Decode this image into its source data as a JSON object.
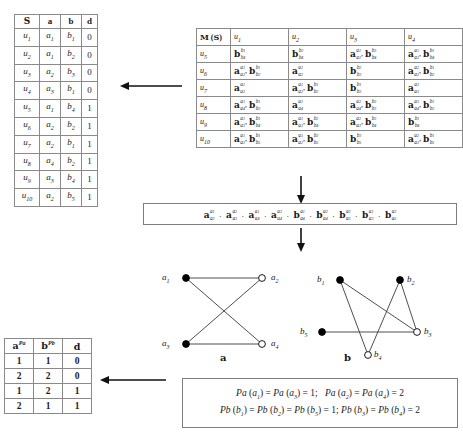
{
  "s_table": {
    "headers": [
      "S",
      "a",
      "b",
      "d"
    ],
    "rows": [
      {
        "u": "u1",
        "a": "a1",
        "b": "b1",
        "d": "0"
      },
      {
        "u": "u2",
        "a": "a1",
        "b": "b2",
        "d": "0"
      },
      {
        "u": "u3",
        "a": "a2",
        "b": "b3",
        "d": "0"
      },
      {
        "u": "u4",
        "a": "a3",
        "b": "b1",
        "d": "0"
      },
      {
        "u": "u5",
        "a": "a1",
        "b": "b4",
        "d": "1"
      },
      {
        "u": "u6",
        "a": "a2",
        "b": "b2",
        "d": "1"
      },
      {
        "u": "u7",
        "a": "a2",
        "b": "b1",
        "d": "1"
      },
      {
        "u": "u8",
        "a": "a4",
        "b": "b2",
        "d": "1"
      },
      {
        "u": "u9",
        "a": "a3",
        "b": "b4",
        "d": "1"
      },
      {
        "u": "u10",
        "a": "a2",
        "b": "b5",
        "d": "1"
      }
    ]
  },
  "m_table": {
    "corner": "M (S)",
    "col_headers": [
      "u1",
      "u2",
      "u3",
      "u4"
    ],
    "row_headers": [
      "u5",
      "u6",
      "u7",
      "u8",
      "u9",
      "u10"
    ],
    "cells": [
      [
        [
          {
            "base": "b",
            "sup": "b1",
            "sub": "b4"
          }
        ],
        [
          {
            "base": "b",
            "sup": "b2",
            "sub": "b4"
          }
        ],
        [
          {
            "base": "a",
            "sup": "a1",
            "sub": "a2"
          },
          {
            "base": "b",
            "sup": "b3",
            "sub": "b4"
          }
        ],
        [
          {
            "base": "a",
            "sup": "a1",
            "sub": "a3"
          },
          {
            "base": "b",
            "sup": "b1",
            "sub": "b4"
          }
        ]
      ],
      [
        [
          {
            "base": "a",
            "sup": "a1",
            "sub": "a2"
          },
          {
            "base": "b",
            "sup": "b1",
            "sub": "b2"
          }
        ],
        [
          {
            "base": "a",
            "sup": "a1",
            "sub": "a2"
          }
        ],
        [
          {
            "base": "b",
            "sup": "b2",
            "sub": "b3"
          }
        ],
        [
          {
            "base": "a",
            "sup": "a2",
            "sub": "a3"
          },
          {
            "base": "b",
            "sup": "b1",
            "sub": "b2"
          }
        ]
      ],
      [
        [
          {
            "base": "a",
            "sup": "a1",
            "sub": "a2"
          }
        ],
        [
          {
            "base": "a",
            "sup": "a1",
            "sub": "a2"
          },
          {
            "base": "b",
            "sup": "b1",
            "sub": "b2"
          }
        ],
        [
          {
            "base": "b",
            "sup": "b1",
            "sub": "b3"
          }
        ],
        [
          {
            "base": "a",
            "sup": "a2",
            "sub": "a3"
          }
        ]
      ],
      [
        [
          {
            "base": "a",
            "sup": "a1",
            "sub": "a4"
          },
          {
            "base": "b",
            "sup": "b1",
            "sub": "b2"
          }
        ],
        [
          {
            "base": "a",
            "sup": "a1",
            "sub": "a4"
          }
        ],
        [
          {
            "base": "a",
            "sup": "a2",
            "sub": "a4"
          },
          {
            "base": "b",
            "sup": "b2",
            "sub": "b3"
          }
        ],
        [
          {
            "base": "a",
            "sup": "a3",
            "sub": "a4"
          },
          {
            "base": "b",
            "sup": "b1",
            "sub": "b2"
          }
        ]
      ],
      [
        [
          {
            "base": "a",
            "sup": "a1",
            "sub": "a3"
          },
          {
            "base": "b",
            "sup": "b1",
            "sub": "b4"
          }
        ],
        [
          {
            "base": "a",
            "sup": "a1",
            "sub": "a3"
          },
          {
            "base": "b",
            "sup": "b2",
            "sub": "b4"
          }
        ],
        [
          {
            "base": "a",
            "sup": "a2",
            "sub": "a3"
          },
          {
            "base": "b",
            "sup": "b3",
            "sub": "b4"
          }
        ],
        [
          {
            "base": "b",
            "sup": "b1",
            "sub": "b4"
          }
        ]
      ],
      [
        [
          {
            "base": "a",
            "sup": "a1",
            "sub": "a2"
          },
          {
            "base": "b",
            "sup": "b1",
            "sub": "b5"
          }
        ],
        [
          {
            "base": "a",
            "sup": "a1",
            "sub": "a2"
          },
          {
            "base": "b",
            "sup": "b2",
            "sub": "b5"
          }
        ],
        [
          {
            "base": "b",
            "sup": "b3",
            "sub": "b5"
          }
        ],
        [
          {
            "base": "a",
            "sup": "a2",
            "sub": "a3"
          },
          {
            "base": "b",
            "sup": "b1",
            "sub": "b5"
          }
        ]
      ]
    ]
  },
  "product_box": {
    "terms": [
      {
        "base": "a",
        "sup": "a1",
        "sub": "a2"
      },
      {
        "base": "a",
        "sup": "a2",
        "sub": "a3"
      },
      {
        "base": "a",
        "sup": "a1",
        "sub": "a4"
      },
      {
        "base": "a",
        "sup": "a3",
        "sub": "a4"
      },
      {
        "base": "b",
        "sup": "a1",
        "sub": "a4"
      },
      {
        "base": "b",
        "sup": "a2",
        "sub": "a4"
      },
      {
        "base": "b",
        "sup": "a2",
        "sub": "a3"
      },
      {
        "base": "b",
        "sup": "a1",
        "sub": "a3"
      },
      {
        "base": "b",
        "sup": "a3",
        "sub": "a5"
      }
    ],
    "separator": "·"
  },
  "graph_a": {
    "caption": "a",
    "nodes": [
      {
        "id": "a1",
        "label": "a1",
        "x": 36,
        "y": 26,
        "filled": true,
        "label_x": 12,
        "label_y": 20
      },
      {
        "id": "a2",
        "label": "a2",
        "x": 112,
        "y": 26,
        "filled": false,
        "label_x": 121,
        "label_y": 20
      },
      {
        "id": "a3",
        "label": "a3",
        "x": 36,
        "y": 92,
        "filled": true,
        "label_x": 12,
        "label_y": 86
      },
      {
        "id": "a4",
        "label": "a4",
        "x": 112,
        "y": 92,
        "filled": false,
        "label_x": 121,
        "label_y": 86
      }
    ],
    "edges": [
      [
        "a1",
        "a2"
      ],
      [
        "a3",
        "a4"
      ],
      [
        "a1",
        "a4"
      ],
      [
        "a3",
        "a2"
      ]
    ]
  },
  "graph_b": {
    "caption": "b",
    "nodes": [
      {
        "id": "b1",
        "label": "b1",
        "x": 48,
        "y": 28,
        "filled": true,
        "label_x": 25,
        "label_y": 22
      },
      {
        "id": "b2",
        "label": "b2",
        "x": 108,
        "y": 28,
        "filled": true,
        "label_x": 115,
        "label_y": 22
      },
      {
        "id": "b5",
        "label": "b5",
        "x": 30,
        "y": 80,
        "filled": true,
        "label_x": 8,
        "label_y": 74
      },
      {
        "id": "b3",
        "label": "b3",
        "x": 125,
        "y": 80,
        "filled": false,
        "label_x": 132,
        "label_y": 74
      },
      {
        "id": "b4",
        "label": "b4",
        "x": 76,
        "y": 103,
        "filled": false,
        "label_x": 82,
        "label_y": 97
      }
    ],
    "edges": [
      [
        "b1",
        "b3"
      ],
      [
        "b1",
        "b4"
      ],
      [
        "b2",
        "b4"
      ],
      [
        "b2",
        "b3"
      ],
      [
        "b5",
        "b3"
      ]
    ]
  },
  "p_table": {
    "headers": [
      "a",
      "b",
      "d"
    ],
    "header_sups": [
      "Pa",
      "Pb",
      ""
    ],
    "rows": [
      [
        "1",
        "1",
        "0"
      ],
      [
        "2",
        "2",
        "0"
      ],
      [
        "1",
        "2",
        "1"
      ],
      [
        "2",
        "1",
        "1"
      ]
    ]
  },
  "pf_box": {
    "line1": {
      "part1_fn": "Pa",
      "part1_arg1": "a1",
      "part1_arg2": "a3",
      "part1_val": "1",
      "part2_fn": "Pa",
      "part2_arg1": "a2",
      "part2_arg2": "a4",
      "part2_val": "2"
    },
    "line2": {
      "part1_fn": "Pb",
      "part1_arg1": "b1",
      "part1_arg2": "b2",
      "part1_arg3": "b5",
      "part1_val": "1",
      "part2_fn": "Pb",
      "part2_arg1": "b3",
      "part2_arg2": "b4",
      "part2_val": "2"
    }
  }
}
